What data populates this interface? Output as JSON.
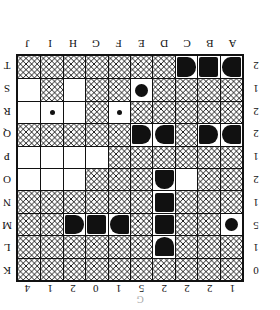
{
  "puzzle": {
    "kind": "battleships-grid",
    "orientation": "upside-down",
    "caption": "G",
    "size": 10,
    "column_clues": [
      1,
      2,
      2,
      2,
      5,
      1,
      0,
      2,
      1,
      4
    ],
    "row_clues": [
      0,
      1,
      5,
      1,
      2,
      1,
      2,
      2,
      1,
      2
    ],
    "column_labels": [
      "A",
      "B",
      "C",
      "D",
      "E",
      "F",
      "G",
      "H",
      "I",
      "J"
    ],
    "row_labels": [
      "K",
      "L",
      "M",
      "N",
      "O",
      "P",
      "Q",
      "R",
      "S",
      "T"
    ],
    "colors": {
      "ink": "#111111",
      "paper": "#ffffff"
    },
    "cells": [
      [
        "water",
        "water",
        "water",
        "water",
        "water",
        "water",
        "water",
        "water",
        "water",
        "water"
      ],
      [
        "water",
        "water",
        "water",
        "bottom",
        "water",
        "water",
        "water",
        "water",
        "water",
        "water"
      ],
      [
        "sub",
        "water",
        "water",
        "mid",
        "water",
        "right",
        "mid",
        "left",
        "water",
        "water"
      ],
      [
        "water",
        "water",
        "water",
        "mid",
        "water",
        "water",
        "water",
        "water",
        "water",
        "water"
      ],
      [
        "water",
        "water",
        "empty",
        "top",
        "water",
        "water",
        "water",
        "empty",
        "empty",
        "empty"
      ],
      [
        "water",
        "water",
        "water",
        "water",
        "water",
        "water",
        "empty",
        "empty",
        "empty",
        "empty"
      ],
      [
        "right",
        "left",
        "water",
        "right",
        "left",
        "water",
        "water",
        "water",
        "water",
        "water"
      ],
      [
        "water",
        "water",
        "water",
        "water",
        "water",
        "dot",
        "water",
        "empty",
        "dot",
        "empty"
      ],
      [
        "water",
        "water",
        "water",
        "water",
        "sub",
        "water",
        "water",
        "empty",
        "water",
        "empty"
      ],
      [
        "right",
        "mid",
        "left",
        "water",
        "water",
        "water",
        "water",
        "water",
        "water",
        "water"
      ]
    ]
  }
}
